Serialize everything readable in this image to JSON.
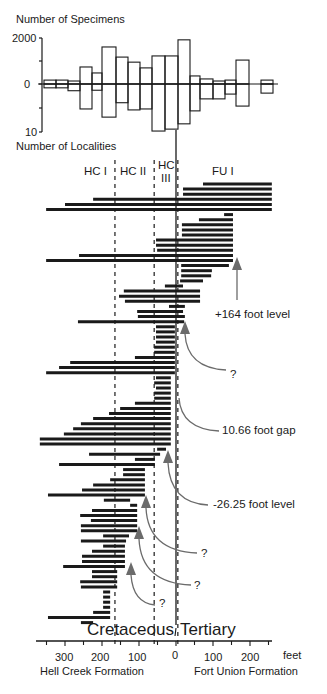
{
  "chart_data": [
    {
      "type": "bar",
      "title": "Number of Specimens / Number of Localities",
      "ylabel_top": "Number of Specimens",
      "ylabel_bottom": "Number of Localities",
      "y_ticks_top": [
        "2000",
        "",
        "0"
      ],
      "y_ticks_bottom": [
        "",
        "10"
      ],
      "ylim_top": [
        0,
        2000
      ],
      "ylim_bottom": [
        0,
        10
      ],
      "grid": false,
      "categories_px": [
        [
          44,
          56
        ],
        [
          56,
          68
        ],
        [
          68,
          80
        ],
        [
          80,
          92
        ],
        [
          92,
          102
        ],
        [
          102,
          116
        ],
        [
          116,
          128
        ],
        [
          128,
          140
        ],
        [
          140,
          152
        ],
        [
          152,
          165
        ],
        [
          165,
          178
        ],
        [
          178,
          190
        ],
        [
          190,
          200
        ],
        [
          200,
          213
        ],
        [
          213,
          225
        ],
        [
          225,
          236
        ],
        [
          236,
          249
        ],
        [
          261,
          273
        ]
      ],
      "series": [
        {
          "name": "Number of Specimens",
          "values": [
            170,
            170,
            130,
            740,
            480,
            1610,
            1170,
            950,
            700,
            1220,
            1220,
            1920,
            350,
            220,
            130,
            170,
            1040,
            170
          ]
        },
        {
          "name": "Number of Localities",
          "values": [
            0.8,
            0.8,
            1.4,
            5.2,
            1.3,
            6.9,
            3.9,
            5.4,
            5.2,
            9.8,
            9.4,
            8.3,
            5.6,
            3.1,
            3.1,
            2.1,
            4.6,
            1.9
          ]
        }
      ]
    },
    {
      "type": "range",
      "title": "Stratigraphic ranges of taxa across Cretaceous/Tertiary boundary",
      "xlabel": "feet",
      "x_tick_labels": [
        "300",
        "200",
        "100",
        "0",
        "100",
        "200"
      ],
      "x_tick_values": [
        -300,
        -200,
        -100,
        0,
        100,
        200
      ],
      "xlim": [
        -350,
        250
      ],
      "x_unit": "feet",
      "x_left_group": "Hell Creek Formation",
      "x_right_group": "Fort Union Formation",
      "zones": [
        {
          "label": "HC I",
          "from": -350,
          "to": -165
        },
        {
          "label": "HC II",
          "from": -165,
          "to": -59
        },
        {
          "label": "HC III",
          "from": -59,
          "to": 5
        },
        {
          "label": "FU I",
          "from": 5,
          "to": 250
        }
      ],
      "boundaries_ft": {
        "hc1_hc2": -165,
        "hc2_hc3": -59,
        "kt_solid": 0,
        "hc3_fu1": 5
      },
      "ranges_ft": [
        [
          73,
          259
        ],
        [
          19,
          259
        ],
        [
          19,
          259
        ],
        [
          -224,
          259
        ],
        [
          -300,
          259
        ],
        [
          -351,
          259
        ],
        [
          130,
          154
        ],
        [
          62,
          154
        ],
        [
          16,
          154
        ],
        [
          16,
          154
        ],
        [
          16,
          154
        ],
        [
          -54,
          154
        ],
        [
          -54,
          154
        ],
        [
          -51,
          154
        ],
        [
          -262,
          154
        ],
        [
          -351,
          154
        ],
        [
          14,
          143
        ],
        [
          14,
          97
        ],
        [
          14,
          95
        ],
        [
          11,
          73
        ],
        [
          -30,
          19
        ],
        [
          -141,
          65
        ],
        [
          -154,
          65
        ],
        [
          -138,
          65
        ],
        [
          -19,
          24
        ],
        [
          -105,
          19
        ],
        [
          -103,
          24
        ],
        [
          -265,
          22
        ],
        [
          -54,
          -3
        ],
        [
          -54,
          -3
        ],
        [
          -54,
          -3
        ],
        [
          -54,
          -3
        ],
        [
          -59,
          -3
        ],
        [
          -59,
          -3
        ],
        [
          -111,
          -3
        ],
        [
          -286,
          -3
        ],
        [
          -316,
          -3
        ],
        [
          -351,
          -3
        ],
        [
          -54,
          -14
        ],
        [
          -59,
          -14
        ],
        [
          -54,
          -14
        ],
        [
          -59,
          -14
        ],
        [
          -59,
          -14
        ],
        [
          -111,
          -14
        ],
        [
          -151,
          -14
        ],
        [
          -181,
          -14
        ],
        [
          -224,
          -14
        ],
        [
          -257,
          -14
        ],
        [
          -278,
          -14
        ],
        [
          -303,
          -14
        ],
        [
          -368,
          -14
        ],
        [
          -368,
          -14
        ],
        [
          -51,
          -27
        ],
        [
          -235,
          -43
        ],
        [
          -111,
          -57
        ],
        [
          -316,
          -57
        ],
        [
          -143,
          -84
        ],
        [
          -143,
          -84
        ],
        [
          -178,
          -84
        ],
        [
          -224,
          -84
        ],
        [
          -254,
          -84
        ],
        [
          -346,
          -84
        ],
        [
          -195,
          -124
        ],
        [
          -124,
          -105
        ],
        [
          -227,
          -105
        ],
        [
          -259,
          -105
        ],
        [
          -230,
          -105
        ],
        [
          -257,
          -105
        ],
        [
          -257,
          -105
        ],
        [
          -197,
          -127
        ],
        [
          -257,
          -135
        ],
        [
          -197,
          -138
        ],
        [
          -227,
          -138
        ],
        [
          -254,
          -138
        ],
        [
          -254,
          -138
        ],
        [
          -305,
          -138
        ],
        [
          -227,
          -159
        ],
        [
          -227,
          -159
        ],
        [
          -259,
          -159
        ],
        [
          -257,
          -159
        ],
        [
          -197,
          -178
        ],
        [
          -197,
          -178
        ],
        [
          -197,
          -178
        ],
        [
          -197,
          -178
        ],
        [
          -224,
          -178
        ],
        [
          -346,
          -178
        ],
        [
          -257,
          -224
        ]
      ],
      "annotations": [
        {
          "text": "+164 foot level",
          "arrow_target_ft": 164
        },
        {
          "text": "?",
          "arrow_target_ft": 14
        },
        {
          "text": "10.66 foot gap",
          "arrow_target_ft": 0
        },
        {
          "text": "-26.25 foot level",
          "arrow_target_ft": -26
        },
        {
          "text": "?",
          "arrow_target_ft": -100
        },
        {
          "text": "?",
          "arrow_target_ft": -119
        },
        {
          "text": "?",
          "arrow_target_ft": -141
        }
      ],
      "boundary_labels": {
        "left": "Cretaceous",
        "right": "Tertiary"
      }
    }
  ],
  "labels": {
    "specimens": "Number of Specimens",
    "localities": "Number of Localities",
    "tick_2000": "2000",
    "tick_0": "0",
    "tick_10": "10",
    "zone_hc1": "HC I",
    "zone_hc2": "HC  II",
    "zone_hc3_a": "HC",
    "zone_hc3_b": "III",
    "zone_fu1": "FU I",
    "ann_164": "+164 foot level",
    "ann_q1": "?",
    "ann_gap": "10.66 foot gap",
    "ann_26": "-26.25 foot level",
    "ann_q2": "?",
    "ann_q3": "?",
    "ann_q4": "?",
    "cretaceous": "Cretaceous",
    "tertiary": "Tertiary",
    "x300": "300",
    "x200l": "200",
    "x100l": "100",
    "x0": "0",
    "x100r": "100",
    "x200r": "200",
    "feet": "feet",
    "hell_creek": "Hell Creek Formation",
    "fort_union": "Fort Union Formation"
  },
  "colors": {
    "ink": "#1a1a1a",
    "arrow": "#6b6b6b",
    "background": "#ffffff"
  }
}
